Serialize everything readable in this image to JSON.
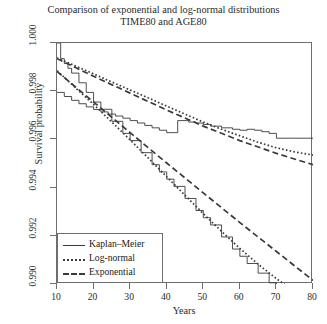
{
  "chart_data": {
    "type": "line",
    "title": "Comparison of exponential and log-normal distributions",
    "subtitle": "TIME80 and AGE80",
    "xlabel": "Years",
    "ylabel": "Survival probability",
    "xlim": [
      10,
      80
    ],
    "ylim": [
      0.99,
      1.0
    ],
    "xticks": [
      10,
      20,
      30,
      40,
      50,
      60,
      70,
      80
    ],
    "yticks": [
      "1.000",
      "0.998",
      "0.996",
      "0.994",
      "0.992",
      "0.990"
    ],
    "ytick_values": [
      1.0,
      0.998,
      0.996,
      0.994,
      0.992,
      0.99
    ],
    "grid": false,
    "legend_position": "bottom-left",
    "legend": [
      {
        "label": "Kaplan–Meier",
        "style": "solid"
      },
      {
        "label": "Log-normal",
        "style": "dotted"
      },
      {
        "label": "Exponential",
        "style": "dashed"
      }
    ],
    "series": [
      {
        "name": "TIME80 Kaplan-Meier",
        "group": "TIME80",
        "style": "step",
        "x": [
          10,
          11,
          12,
          13,
          14,
          16,
          18,
          20,
          22,
          25,
          28,
          30,
          33,
          36,
          38,
          40,
          42,
          45,
          48,
          50,
          52,
          55,
          58,
          60,
          62,
          65,
          68,
          70,
          72,
          74,
          76,
          78,
          80
        ],
        "y": [
          1.0,
          0.99935,
          0.99915,
          0.99895,
          0.99875,
          0.99835,
          0.99795,
          0.99755,
          0.99725,
          0.99675,
          0.99625,
          0.99595,
          0.99545,
          0.99495,
          0.99465,
          0.99435,
          0.99405,
          0.99355,
          0.99305,
          0.99275,
          0.99245,
          0.99195,
          0.99145,
          0.99115,
          0.99085,
          0.99045,
          0.99005,
          0.98985,
          0.98965,
          0.98945,
          0.98925,
          0.98915,
          0.98905
        ]
      },
      {
        "name": "TIME80 Log-normal",
        "group": "TIME80",
        "style": "dotted",
        "x": [
          10,
          15,
          20,
          25,
          30,
          35,
          40,
          45,
          50,
          55,
          60,
          65,
          70,
          75,
          80
        ],
        "y": [
          0.99885,
          0.99815,
          0.99745,
          0.99672,
          0.99598,
          0.99522,
          0.99445,
          0.99368,
          0.99292,
          0.99218,
          0.99148,
          0.99082,
          0.99022,
          0.98968,
          0.98922
        ]
      },
      {
        "name": "TIME80 Exponential",
        "group": "TIME80",
        "style": "dashed",
        "x": [
          10,
          20,
          30,
          40,
          50,
          60,
          70,
          80
        ],
        "y": [
          0.99882,
          0.99755,
          0.99628,
          0.99502,
          0.99378,
          0.99255,
          0.99135,
          0.99015
        ]
      },
      {
        "name": "AGE80 Kaplan-Meier",
        "group": "AGE80",
        "style": "step",
        "x": [
          10,
          12,
          14,
          16,
          18,
          20,
          22,
          24,
          26,
          28,
          30,
          32,
          34,
          36,
          38,
          40,
          43,
          46,
          48,
          50,
          52,
          55,
          58,
          60,
          62,
          64,
          66,
          68,
          70,
          75,
          80
        ],
        "y": [
          0.99795,
          0.99778,
          0.99762,
          0.99748,
          0.99735,
          0.99724,
          0.99714,
          0.99705,
          0.99697,
          0.99688,
          0.99678,
          0.99668,
          0.99658,
          0.99648,
          0.99638,
          0.99628,
          0.99678,
          0.99672,
          0.99668,
          0.99662,
          0.99655,
          0.99648,
          0.99642,
          0.99638,
          0.99642,
          0.99638,
          0.99632,
          0.99625,
          0.99605,
          0.99605,
          0.99605
        ]
      },
      {
        "name": "AGE80 Log-normal",
        "group": "AGE80",
        "style": "dotted",
        "x": [
          10,
          15,
          20,
          25,
          30,
          35,
          40,
          45,
          50,
          55,
          60,
          65,
          70,
          75,
          80
        ],
        "y": [
          0.99938,
          0.99905,
          0.99872,
          0.99838,
          0.99805,
          0.99772,
          0.99738,
          0.99705,
          0.99672,
          0.99642,
          0.99615,
          0.99588,
          0.99565,
          0.99548,
          0.99535
        ]
      },
      {
        "name": "AGE80 Exponential",
        "group": "AGE80",
        "style": "dashed",
        "x": [
          10,
          20,
          30,
          40,
          50,
          60,
          70,
          80
        ],
        "y": [
          0.99935,
          0.99862,
          0.99792,
          0.99722,
          0.99655,
          0.99595,
          0.99542,
          0.99495
        ]
      }
    ],
    "colors": {
      "line": "#3a3a3a",
      "frame": "#6e6e6e",
      "background": "#ffffff"
    }
  }
}
